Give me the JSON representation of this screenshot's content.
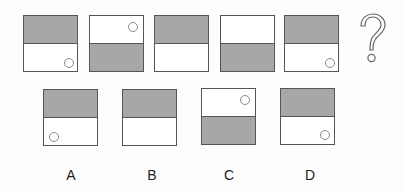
{
  "question_mark": "?",
  "sequence": [
    {
      "shaded": "top",
      "circle": "bottom-right"
    },
    {
      "shaded": "bottom",
      "circle": "top-right"
    },
    {
      "shaded": "top",
      "circle": "none"
    },
    {
      "shaded": "bottom",
      "circle": "none"
    },
    {
      "shaded": "top",
      "circle": "bottom-right"
    }
  ],
  "options": [
    {
      "label": "A",
      "shaded": "top",
      "circle": "bottom-left"
    },
    {
      "label": "B",
      "shaded": "top",
      "circle": "none"
    },
    {
      "label": "C",
      "shaded": "bottom",
      "circle": "top-right"
    },
    {
      "label": "D",
      "shaded": "top",
      "circle": "bottom-right"
    }
  ],
  "colors": {
    "shade": "#a7a7a7",
    "border": "#555555",
    "circle": "#8a8a8a"
  }
}
